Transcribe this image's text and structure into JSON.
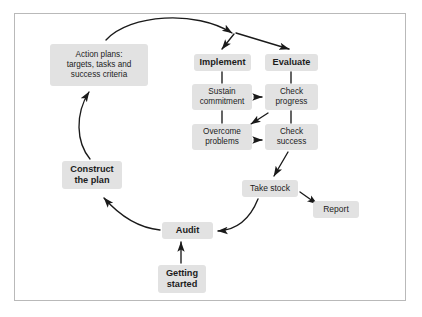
{
  "diagram": {
    "frame": {
      "border_color": "#b9b9b9",
      "background": "#ffffff"
    },
    "style": {
      "node_fill": "#e2e2e2",
      "text_color": "#1c1c1c",
      "arrow_color": "#1a1a1a"
    },
    "nodes": [
      {
        "id": "action-plans",
        "label": "Action plans:\ntargets, tasks and\nsuccess criteria",
        "bold": false,
        "x": 50,
        "y": 44,
        "w": 98,
        "h": 42,
        "font": 8.2
      },
      {
        "id": "implement",
        "label": "Implement",
        "bold": true,
        "x": 194,
        "y": 54,
        "w": 57,
        "h": 17,
        "font": 9.2
      },
      {
        "id": "evaluate",
        "label": "Evaluate",
        "bold": true,
        "x": 265,
        "y": 54,
        "w": 53,
        "h": 17,
        "font": 9.2
      },
      {
        "id": "sustain-commitment",
        "label": "Sustain\ncommitment",
        "bold": false,
        "x": 192,
        "y": 84,
        "w": 60,
        "h": 26,
        "font": 8.2
      },
      {
        "id": "check-progress",
        "label": "Check\nprogress",
        "bold": false,
        "x": 265,
        "y": 84,
        "w": 53,
        "h": 26,
        "font": 8.2
      },
      {
        "id": "overcome-problems",
        "label": "Overcome\nproblems",
        "bold": false,
        "x": 192,
        "y": 124,
        "w": 60,
        "h": 26,
        "font": 8.2
      },
      {
        "id": "check-success",
        "label": "Check\nsuccess",
        "bold": false,
        "x": 265,
        "y": 124,
        "w": 53,
        "h": 26,
        "font": 8.2
      },
      {
        "id": "take-stock",
        "label": "Take stock",
        "bold": false,
        "x": 242,
        "y": 180,
        "w": 56,
        "h": 17,
        "font": 8.5
      },
      {
        "id": "report",
        "label": "Report",
        "bold": false,
        "x": 313,
        "y": 201,
        "w": 46,
        "h": 17,
        "font": 8.5
      },
      {
        "id": "construct-plan",
        "label": "Construct\nthe plan",
        "bold": true,
        "x": 62,
        "y": 161,
        "w": 60,
        "h": 28,
        "font": 9.2
      },
      {
        "id": "audit",
        "label": "Audit",
        "bold": true,
        "x": 162,
        "y": 222,
        "w": 51,
        "h": 17,
        "font": 9.2
      },
      {
        "id": "getting-started",
        "label": "Getting\nstarted",
        "bold": true,
        "x": 158,
        "y": 265,
        "w": 48,
        "h": 28,
        "font": 9.2
      }
    ],
    "connectors": [
      {
        "id": "action-plans-to-fork",
        "from": "action-plans",
        "to": "fork-point",
        "kind": "curved-arrow"
      },
      {
        "id": "fork-to-implement",
        "from": "fork-point",
        "to": "implement",
        "kind": "arrow"
      },
      {
        "id": "fork-to-evaluate",
        "from": "fork-point",
        "to": "evaluate",
        "kind": "arrow"
      },
      {
        "id": "implement-to-sustain",
        "from": "implement",
        "to": "sustain-commitment",
        "kind": "tick"
      },
      {
        "id": "evaluate-to-check-progress",
        "from": "evaluate",
        "to": "check-progress",
        "kind": "tick"
      },
      {
        "id": "sustain-to-overcome",
        "from": "sustain-commitment",
        "to": "overcome-problems",
        "kind": "tick"
      },
      {
        "id": "check-progress-to-success",
        "from": "check-progress",
        "to": "check-success",
        "kind": "tick"
      },
      {
        "id": "sustain-to-check-progress",
        "from": "sustain-commitment",
        "to": "check-progress",
        "kind": "arrow"
      },
      {
        "id": "check-progress-to-overcome",
        "from": "check-progress",
        "to": "overcome-problems",
        "kind": "diagonal-arrow"
      },
      {
        "id": "overcome-to-check-success",
        "from": "overcome-problems",
        "to": "check-success",
        "kind": "arrow"
      },
      {
        "id": "check-success-to-take-stock",
        "from": "check-success",
        "to": "take-stock",
        "kind": "diagonal-arrow"
      },
      {
        "id": "take-stock-to-report",
        "from": "take-stock",
        "to": "report",
        "kind": "diagonal-arrow"
      },
      {
        "id": "take-stock-to-audit",
        "from": "take-stock",
        "to": "audit",
        "kind": "curved-arrow"
      },
      {
        "id": "getting-started-to-audit",
        "from": "getting-started",
        "to": "audit",
        "kind": "arrow"
      },
      {
        "id": "audit-to-construct",
        "from": "audit",
        "to": "construct-plan",
        "kind": "curved-arrow"
      },
      {
        "id": "construct-to-action-plans",
        "from": "construct-plan",
        "to": "action-plans",
        "kind": "curved-arrow"
      }
    ]
  }
}
